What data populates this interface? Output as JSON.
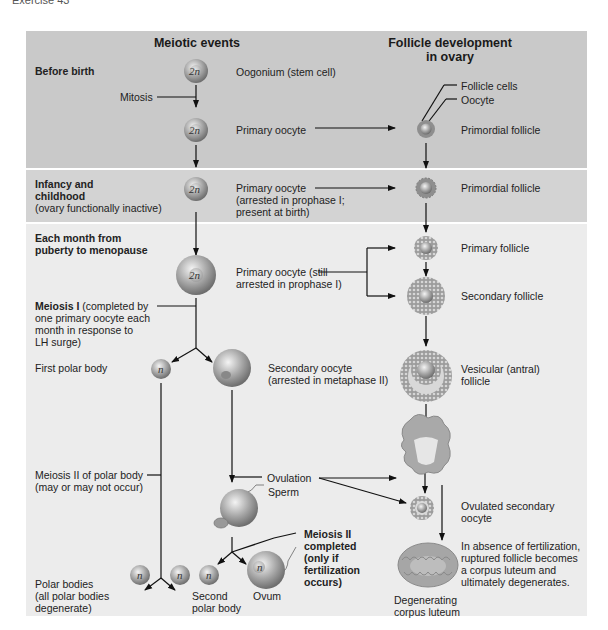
{
  "page_header": "Exercise 43",
  "columns": {
    "meiotic": "Meiotic events",
    "follicle_line1": "Follicle development",
    "follicle_line2": "in ovary"
  },
  "stages": {
    "before_birth": "Before birth",
    "infancy_line1": "Infancy and",
    "infancy_line2": "childhood",
    "infancy_note": "(ovary functionally inactive)",
    "monthly_line1": "Each month from",
    "monthly_line2": "puberty to menopause"
  },
  "cells": {
    "diploid": "2n",
    "haploid": "n"
  },
  "meiotic_labels": {
    "oogonium": "Oogonium (stem cell)",
    "mitosis": "Mitosis",
    "primary_oocyte": "Primary oocyte",
    "primary_arrested_1": "Primary oocyte",
    "primary_arrested_2": "(arrested in prophase I;",
    "primary_arrested_3": "present at birth)",
    "primary_still_1": "Primary oocyte (still",
    "primary_still_2": "arrested in prophase I)",
    "meiosis1_bold": "Meiosis I",
    "meiosis1_1": " (completed by",
    "meiosis1_2": "one primary oocyte each",
    "meiosis1_3": "month in response to",
    "meiosis1_4": "LH surge)",
    "first_polar_body": "First polar body",
    "secondary_oocyte_1": "Secondary oocyte",
    "secondary_oocyte_2": "(arrested in metaphase II)",
    "meiosis2_polar_1": "Meiosis II of polar body",
    "meiosis2_polar_2": "(may or may not occur)",
    "ovulation": "Ovulation",
    "sperm": "Sperm",
    "meiosis2_done_1": "Meiosis II",
    "meiosis2_done_2": "completed",
    "meiosis2_done_3": "(only if",
    "meiosis2_done_4": "fertilization",
    "meiosis2_done_5": "occurs)",
    "polar_bodies_1": "Polar bodies",
    "polar_bodies_2": "(all polar bodies",
    "polar_bodies_3": "degenerate)",
    "second_polar_1": "Second",
    "second_polar_2": "polar body",
    "ovum": "Ovum"
  },
  "follicle_labels": {
    "follicle_cells": "Follicle cells",
    "oocyte": "Oocyte",
    "primordial_1": "Primordial follicle",
    "primordial_2": "Primordial follicle",
    "primary": "Primary follicle",
    "secondary": "Secondary follicle",
    "vesicular_1": "Vesicular (antral)",
    "vesicular_2": "follicle",
    "ovulated_1": "Ovulated secondary",
    "ovulated_2": "oocyte",
    "absence_1": "In absence of fertilization,",
    "absence_2": "ruptured follicle becomes",
    "absence_3": "a corpus luteum and",
    "absence_4": "ultimately degenerates.",
    "degenerating_1": "Degenerating",
    "degenerating_2": "corpus luteum"
  },
  "colors": {
    "band_before_birth": "#c9c9c9",
    "band_infancy": "#d3d3d3",
    "band_monthly": "#ececec",
    "arrow": "#111111"
  }
}
